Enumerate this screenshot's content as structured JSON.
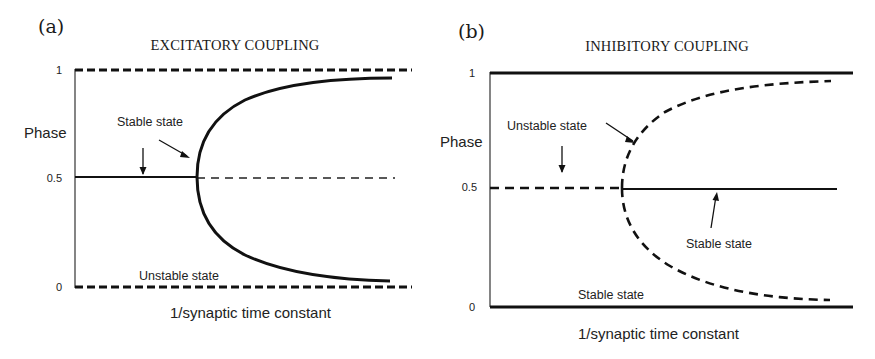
{
  "panels": [
    {
      "label": "(a)",
      "title": "EXCITATORY COUPLING",
      "y_axis_label": "Phase",
      "x_axis_label": "1/synaptic time constant",
      "y_ticks": [
        "1",
        "0.5",
        "0"
      ],
      "annotations": {
        "upper": "Stable state",
        "lower": "Unstable state"
      },
      "lines": {
        "phase_1": "unstable (dashed)",
        "phase_0": "unstable (dashed)",
        "phase_half_before_bifurcation": "stable (solid)",
        "phase_half_after_bifurcation": "unstable (dashed)",
        "bifurcation_branches": "stable (solid)"
      }
    },
    {
      "label": "(b)",
      "title": "INHIBITORY COUPLING",
      "y_axis_label": "Phase",
      "x_axis_label": "1/synaptic time constant",
      "y_ticks": [
        "1",
        "0.5",
        "0"
      ],
      "annotations": {
        "upper": "Unstable state",
        "middle": "Stable state",
        "lower": "Stable state"
      },
      "lines": {
        "phase_1": "stable (solid)",
        "phase_0": "stable (solid)",
        "phase_half_before_bifurcation": "unstable (dashed)",
        "phase_half_after_bifurcation": "stable (solid)",
        "bifurcation_branches": "unstable (dashed)"
      }
    }
  ]
}
